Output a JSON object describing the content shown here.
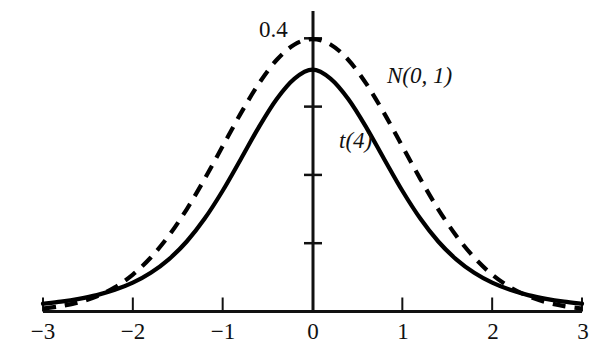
{
  "chart_data": {
    "type": "line",
    "title": "",
    "subtitle": "",
    "xlabel": "",
    "ylabel": "",
    "xlim": [
      -3,
      3
    ],
    "ylim": [
      0,
      0.42
    ],
    "grid": false,
    "legend_position": "inline-annotations",
    "x_ticks": [
      -3,
      -2,
      -1,
      0,
      1,
      2,
      3
    ],
    "x_tick_labels": [
      "−3",
      "−2",
      "−1",
      "0",
      "1",
      "2",
      "3"
    ],
    "y_ticks": [
      0.1,
      0.2,
      0.3,
      0.4
    ],
    "y_tick_labels": [
      "",
      "",
      "",
      "0.4"
    ],
    "y_axis_top_value": 0.44,
    "annotations": [
      {
        "text": "N(0, 1)",
        "x": 1.05,
        "y": 0.295,
        "style": "italic",
        "series": "N(0, 1)"
      },
      {
        "text": "t(4)",
        "x": 0.35,
        "y": 0.215,
        "style": "italic",
        "series": "t(4)"
      }
    ],
    "series": [
      {
        "name": "t(4)",
        "label": "t(4)",
        "linestyle": "solid",
        "color": "#000000",
        "linewidth": 3,
        "peak_value": 0.375,
        "x": [
          -3.0,
          -2.8,
          -2.6,
          -2.4,
          -2.2,
          -2.0,
          -1.8,
          -1.6,
          -1.4,
          -1.2,
          -1.0,
          -0.8,
          -0.6,
          -0.4,
          -0.2,
          0.0,
          0.2,
          0.4,
          0.6,
          0.8,
          1.0,
          1.2,
          1.4,
          1.6,
          1.8,
          2.0,
          2.2,
          2.4,
          2.6,
          2.8,
          3.0
        ],
        "values": [
          0.0114,
          0.0144,
          0.0185,
          0.024,
          0.0317,
          0.0422,
          0.0567,
          0.0764,
          0.1025,
          0.1361,
          0.1768,
          0.2226,
          0.2693,
          0.3108,
          0.341,
          0.3541,
          0.341,
          0.3108,
          0.2693,
          0.2226,
          0.1768,
          0.1361,
          0.1025,
          0.0764,
          0.0567,
          0.0422,
          0.0317,
          0.024,
          0.0185,
          0.0144,
          0.0114
        ]
      },
      {
        "name": "N(0, 1)",
        "label": "N(0, 1)",
        "linestyle": "dashed",
        "color": "#000000",
        "linewidth": 3,
        "peak_value": 0.399,
        "x": [
          -3.0,
          -2.8,
          -2.6,
          -2.4,
          -2.2,
          -2.0,
          -1.8,
          -1.6,
          -1.4,
          -1.2,
          -1.0,
          -0.8,
          -0.6,
          -0.4,
          -0.2,
          0.0,
          0.2,
          0.4,
          0.6,
          0.8,
          1.0,
          1.2,
          1.4,
          1.6,
          1.8,
          2.0,
          2.2,
          2.4,
          2.6,
          2.8,
          3.0
        ],
        "values": [
          0.0044,
          0.0079,
          0.0136,
          0.0224,
          0.0355,
          0.054,
          0.079,
          0.1109,
          0.1497,
          0.1942,
          0.242,
          0.2897,
          0.3332,
          0.3683,
          0.391,
          0.3989,
          0.391,
          0.3683,
          0.3332,
          0.2897,
          0.242,
          0.1942,
          0.1497,
          0.1109,
          0.079,
          0.054,
          0.0355,
          0.0224,
          0.0136,
          0.0079,
          0.0044
        ]
      }
    ],
    "crossings": [
      -1.65,
      1.65
    ]
  },
  "axis": {
    "y_top_label": "0.4",
    "x_tick_labels": [
      "−3",
      "−2",
      "−1",
      "0",
      "1",
      "2",
      "3"
    ]
  },
  "labels": {
    "normal": "N(0, 1)",
    "t_dist": "t(4)"
  },
  "colors": {
    "axis": "#111111",
    "curve": "#000000",
    "background": "#ffffff"
  }
}
